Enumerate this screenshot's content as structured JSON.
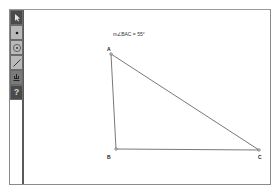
{
  "toolbox": {
    "tools": [
      {
        "name": "selection-arrow",
        "icon": "arrow-icon"
      },
      {
        "name": "point",
        "icon": "point-icon"
      },
      {
        "name": "compass",
        "icon": "circle-icon"
      },
      {
        "name": "straightedge",
        "icon": "segment-icon"
      },
      {
        "name": "custom",
        "icon": "custom-tool-icon"
      },
      {
        "name": "information",
        "icon": "question-icon",
        "glyph": "?"
      }
    ]
  },
  "canvas": {
    "measurement": "m∠BAC = 55°",
    "points": {
      "A": {
        "label": "A"
      },
      "B": {
        "label": "B"
      },
      "C": {
        "label": "C"
      }
    }
  },
  "colors": {
    "frame": "#8a8a8a",
    "toolbar_dark": "#4a4a4a",
    "toolbar_light": "#b9b9b9",
    "line": "#555555"
  }
}
